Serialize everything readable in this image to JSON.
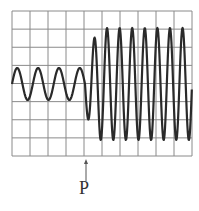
{
  "figure": {
    "label": "P",
    "grid": {
      "columns": 10,
      "rows": 8,
      "x0": 12,
      "y0": 11,
      "x1": 192,
      "y1": 156,
      "color": "#8a8a8a"
    },
    "wave": {
      "color": "#2a2a2a",
      "center_y": 84,
      "segment_before": {
        "x_start": 12,
        "x_end": 85,
        "cycles": 3.5,
        "amplitude": 16
      },
      "segment_after": {
        "x_start": 85,
        "x_end": 192,
        "amplitude_max": 56,
        "cycles": 8.5
      }
    },
    "arrow": {
      "x": 86,
      "y_top": 159,
      "y_bottom": 181
    }
  }
}
